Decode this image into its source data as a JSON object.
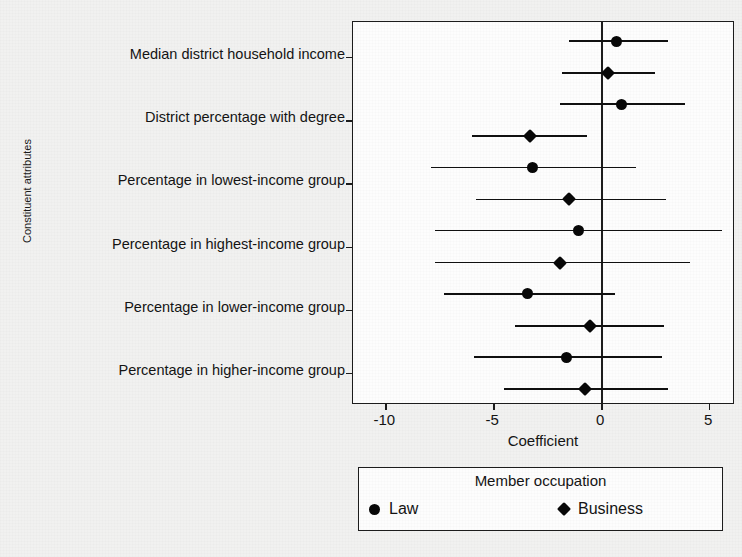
{
  "chart_data": {
    "type": "scatter",
    "subtype": "coefficient-plot-with-confidence-intervals",
    "title": "",
    "xlabel": "Coefficient",
    "ylabel": "Constituent attributes",
    "xlim": [
      -11.5,
      6.2
    ],
    "xticks": [
      -10,
      -5,
      0,
      5
    ],
    "xtick_labels": [
      "-10",
      "-5",
      "0",
      "5"
    ],
    "grid": false,
    "zero_reference_line": 0,
    "categories": [
      "Median district household income",
      "District percentage with degree",
      "Percentage in lowest-income group",
      "Percentage in highest-income group",
      "Percentage in lower-income group",
      "Percentage in higher-income group"
    ],
    "legend": {
      "title": "Member occupation",
      "position": "below-axes",
      "entries": [
        {
          "name": "Law",
          "marker": "circle"
        },
        {
          "name": "Business",
          "marker": "diamond"
        }
      ]
    },
    "series": [
      {
        "name": "Law",
        "marker": "circle",
        "points": [
          {
            "category": "Median district household income",
            "value": 0.7,
            "ci_low": -1.5,
            "ci_high": 3.1
          },
          {
            "category": "District percentage with degree",
            "value": 0.95,
            "ci_low": -1.9,
            "ci_high": 3.9
          },
          {
            "category": "Percentage in lowest-income group",
            "value": -3.2,
            "ci_low": -7.9,
            "ci_high": 1.6
          },
          {
            "category": "Percentage in highest-income group",
            "value": -1.05,
            "ci_low": -7.7,
            "ci_high": 5.6
          },
          {
            "category": "Percentage in lower-income group",
            "value": -3.4,
            "ci_low": -7.3,
            "ci_high": 0.65
          },
          {
            "category": "Percentage in higher-income group",
            "value": -1.6,
            "ci_low": -5.9,
            "ci_high": 2.8
          }
        ]
      },
      {
        "name": "Business",
        "marker": "diamond",
        "points": [
          {
            "category": "Median district household income",
            "value": 0.32,
            "ci_low": -1.8,
            "ci_high": 2.5
          },
          {
            "category": "District percentage with degree",
            "value": -3.3,
            "ci_low": -6.0,
            "ci_high": -0.65
          },
          {
            "category": "Percentage in lowest-income group",
            "value": -1.5,
            "ci_low": -5.8,
            "ci_high": 3.0
          },
          {
            "category": "Percentage in highest-income group",
            "value": -1.9,
            "ci_low": -7.7,
            "ci_high": 4.1
          },
          {
            "category": "Percentage in lower-income group",
            "value": -0.52,
            "ci_low": -4.0,
            "ci_high": 2.9
          },
          {
            "category": "Percentage in higher-income group",
            "value": -0.75,
            "ci_low": -4.5,
            "ci_high": 3.1
          }
        ]
      }
    ]
  },
  "colors": {
    "marker": "#080808",
    "axis": "#1c1c1c",
    "background": "#f1f1f0",
    "plot_background": "#fdfdfd"
  }
}
